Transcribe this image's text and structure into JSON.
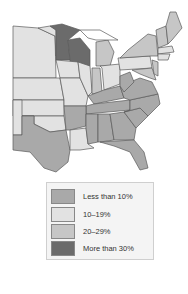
{
  "map": {
    "region": "Eastern United States",
    "colors": {
      "lt10": "#a9a9a9",
      "10_19": "#e2e2e2",
      "20_29": "#c6c6c6",
      "gt30": "#6b6b6b",
      "border": "#5a5a5a",
      "water": "#ffffff"
    }
  },
  "legend": {
    "items": [
      {
        "label": "Less than 10%",
        "color": "#a9a9a9"
      },
      {
        "label": "10–19%",
        "color": "#e2e2e2"
      },
      {
        "label": "20–29%",
        "color": "#c6c6c6"
      },
      {
        "label": "More than 30%",
        "color": "#6b6b6b"
      }
    ]
  }
}
